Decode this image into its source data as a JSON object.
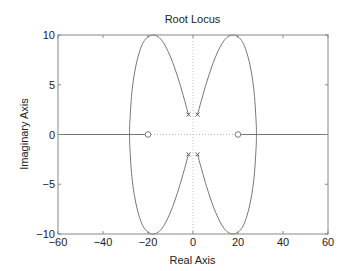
{
  "chart_data": {
    "type": "line",
    "title": "Root Locus",
    "xlabel": "Real Axis",
    "ylabel": "Imaginary Axis",
    "xlim": [
      -60,
      60
    ],
    "ylim": [
      -10,
      10
    ],
    "xticks": [
      -60,
      -40,
      -20,
      0,
      20,
      40,
      60
    ],
    "yticks": [
      -10,
      -5,
      0,
      5,
      10
    ],
    "xtick_labels": [
      "-60",
      "-40",
      "-20",
      "0",
      "20",
      "40",
      "60"
    ],
    "ytick_labels": [
      "-10",
      "-5",
      "0",
      "5",
      "10"
    ],
    "grid": false,
    "zero_axes_dotted": true,
    "poles": [
      {
        "re": -2,
        "im": 2
      },
      {
        "re": 2,
        "im": 2
      },
      {
        "re": -2,
        "im": -2
      },
      {
        "re": 2,
        "im": -2
      }
    ],
    "zeros": [
      {
        "re": -20,
        "im": 0
      },
      {
        "re": 20,
        "im": 0
      }
    ],
    "series": [
      {
        "name": "left branch",
        "points": [
          [
            -2,
            2
          ],
          [
            -6,
            5.2
          ],
          [
            -10,
            7.8
          ],
          [
            -14,
            9.5
          ],
          [
            -18,
            10
          ],
          [
            -22,
            9.3
          ],
          [
            -25,
            7.3
          ],
          [
            -27,
            4.6
          ],
          [
            -28,
            1.5
          ],
          [
            -28.2,
            0
          ],
          [
            -28,
            -1.5
          ],
          [
            -27,
            -4.6
          ],
          [
            -25,
            -7.3
          ],
          [
            -22,
            -9.3
          ],
          [
            -18,
            -10
          ],
          [
            -14,
            -9.5
          ],
          [
            -10,
            -7.8
          ],
          [
            -6,
            -5.2
          ],
          [
            -2,
            -2
          ]
        ]
      },
      {
        "name": "right branch",
        "points": [
          [
            2,
            2
          ],
          [
            6,
            5.2
          ],
          [
            10,
            7.8
          ],
          [
            14,
            9.5
          ],
          [
            18,
            10
          ],
          [
            22,
            9.3
          ],
          [
            25,
            7.3
          ],
          [
            27,
            4.6
          ],
          [
            28,
            1.5
          ],
          [
            28.2,
            0
          ],
          [
            28,
            -1.5
          ],
          [
            27,
            -4.6
          ],
          [
            25,
            -7.3
          ],
          [
            22,
            -9.3
          ],
          [
            18,
            -10
          ],
          [
            14,
            -9.5
          ],
          [
            10,
            -7.8
          ],
          [
            6,
            -5.2
          ],
          [
            2,
            -2
          ]
        ]
      },
      {
        "name": "left real-axis segment",
        "points": [
          [
            -60,
            0
          ],
          [
            -20,
            0
          ]
        ]
      },
      {
        "name": "right real-axis segment",
        "points": [
          [
            20,
            0
          ],
          [
            60,
            0
          ]
        ]
      }
    ],
    "colors": {
      "locus": "#777777",
      "axes": "#888888",
      "text": "#222222",
      "dotted": "#bbbbbb"
    }
  }
}
